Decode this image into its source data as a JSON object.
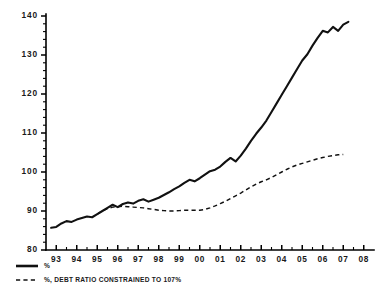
{
  "chart_data": {
    "type": "line",
    "title": "",
    "subtitle": "",
    "xlabel": "",
    "ylabel": "",
    "xlim": [
      1992.5,
      2008.5
    ],
    "ylim": [
      80,
      140
    ],
    "ytick_labels": [
      "80",
      "90",
      "100",
      "110",
      "120",
      "130",
      "140"
    ],
    "ytick_values": [
      80,
      90,
      100,
      110,
      120,
      130,
      140
    ],
    "yminor_step": 2,
    "xtick_labels": [
      "93",
      "94",
      "95",
      "96",
      "97",
      "98",
      "99",
      "00",
      "01",
      "02",
      "03",
      "04",
      "05",
      "06",
      "07",
      "08"
    ],
    "xtick_values": [
      1993,
      1994,
      1995,
      1996,
      1997,
      1998,
      1999,
      2000,
      2001,
      2002,
      2003,
      2004,
      2005,
      2006,
      2007,
      2008
    ],
    "grid": false,
    "legend_position": "below-left",
    "axis_color": "#000000",
    "line_color": "#111111",
    "background": "#ffffff",
    "series": [
      {
        "name": "%",
        "style": "solid",
        "x": [
          1992.75,
          1993.0,
          1993.25,
          1993.5,
          1993.75,
          1994.0,
          1994.25,
          1994.5,
          1994.75,
          1995.0,
          1995.25,
          1995.5,
          1995.75,
          1996.0,
          1996.25,
          1996.5,
          1996.75,
          1997.0,
          1997.25,
          1997.5,
          1997.75,
          1998.0,
          1998.25,
          1998.5,
          1998.75,
          1999.0,
          1999.25,
          1999.5,
          1999.75,
          2000.0,
          2000.25,
          2000.5,
          2000.75,
          2001.0,
          2001.25,
          2001.5,
          2001.75,
          2002.0,
          2002.25,
          2002.5,
          2002.75,
          2003.0,
          2003.25,
          2003.5,
          2003.75,
          2004.0,
          2004.25,
          2004.5,
          2004.75,
          2005.0,
          2005.25,
          2005.5,
          2005.75,
          2006.0,
          2006.25,
          2006.5,
          2006.75,
          2007.0,
          2007.25
        ],
        "values": [
          85.7,
          85.9,
          86.8,
          87.4,
          87.2,
          87.8,
          88.2,
          88.6,
          88.4,
          89.2,
          90.0,
          90.8,
          91.6,
          91.0,
          91.8,
          92.2,
          91.9,
          92.6,
          93.0,
          92.4,
          92.9,
          93.4,
          94.1,
          94.8,
          95.6,
          96.3,
          97.2,
          98.0,
          97.6,
          98.4,
          99.3,
          100.2,
          100.6,
          101.4,
          102.6,
          103.6,
          102.7,
          104.2,
          106.0,
          108.0,
          109.8,
          111.4,
          113.2,
          115.4,
          117.6,
          119.8,
          122.0,
          124.2,
          126.4,
          128.6,
          130.2,
          132.4,
          134.4,
          136.2,
          135.8,
          137.2,
          136.2,
          137.8,
          138.5
        ]
      },
      {
        "name": "%, DEBT RATIO CONSTRAINED TO 107%",
        "style": "dashed",
        "x": [
          1995.0,
          1995.25,
          1995.5,
          1995.75,
          1996.0,
          1996.25,
          1996.5,
          1996.75,
          1997.0,
          1997.25,
          1997.5,
          1997.75,
          1998.0,
          1998.25,
          1998.5,
          1998.75,
          1999.0,
          1999.25,
          1999.5,
          1999.75,
          2000.0,
          2000.25,
          2000.5,
          2000.75,
          2001.0,
          2001.25,
          2001.5,
          2001.75,
          2002.0,
          2002.25,
          2002.5,
          2002.75,
          2003.0,
          2003.25,
          2003.5,
          2003.75,
          2004.0,
          2004.25,
          2004.5,
          2004.75,
          2005.0,
          2005.25,
          2005.5,
          2005.75,
          2006.0,
          2006.25,
          2006.5,
          2006.75,
          2007.0
        ],
        "values": [
          89.2,
          90.0,
          90.6,
          91.0,
          91.1,
          91.2,
          91.1,
          91.0,
          90.9,
          90.8,
          90.6,
          90.4,
          90.2,
          90.1,
          90.0,
          90.0,
          90.1,
          90.2,
          90.2,
          90.2,
          90.2,
          90.4,
          90.8,
          91.3,
          91.9,
          92.5,
          93.2,
          93.9,
          94.6,
          95.4,
          96.2,
          96.9,
          97.5,
          98.0,
          98.6,
          99.3,
          100.0,
          100.7,
          101.3,
          101.8,
          102.2,
          102.6,
          103.0,
          103.4,
          103.7,
          104.0,
          104.2,
          104.4,
          104.5
        ]
      }
    ],
    "legend": [
      {
        "label": "%",
        "style": "solid"
      },
      {
        "label": "%, DEBT RATIO CONSTRAINED TO 107%",
        "style": "dashed"
      }
    ]
  }
}
